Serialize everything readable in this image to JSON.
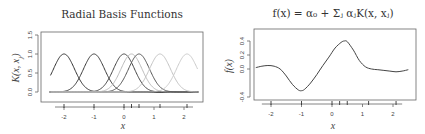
{
  "chart_data": [
    {
      "type": "line",
      "title": "Radial Basis Functions",
      "xlabel": "x",
      "ylabel": "K(x, x_j)",
      "xlim": [
        -2.5,
        2.5
      ],
      "ylim": [
        -0.1,
        1.5
      ],
      "xticks": [
        -2,
        -1,
        0,
        1,
        2
      ],
      "xtick_labels": [
        "-2",
        "-1",
        "0",
        "1",
        "2"
      ],
      "yticks": [
        0.0,
        0.5,
        1.0,
        1.5
      ],
      "ytick_labels": [
        "0.0",
        "0.5",
        "1.0",
        "1.5"
      ],
      "grid": false,
      "kernel": "gaussian",
      "bandwidth_sd": 0.35,
      "centers": [
        -2.0,
        -1.0,
        0.0,
        0.25,
        0.5,
        1.2,
        2.1
      ],
      "series_colors": [
        "#333333",
        "#3a3a3a",
        "#444444",
        "#bbbbbb",
        "#555555",
        "#c4c4c4",
        "#cccccc"
      ],
      "baseline": 0.0,
      "rug": [
        -2.0,
        -1.0,
        0.0,
        0.25,
        0.5,
        1.2,
        2.1
      ]
    },
    {
      "type": "line",
      "title": "f(x) = α₀ + Σⱼ αⱼK(x, xⱼ)",
      "xlabel": "x",
      "ylabel": "f(x)",
      "xlim": [
        -2.5,
        2.5
      ],
      "ylim": [
        -0.45,
        0.55
      ],
      "xticks": [
        -2,
        -1,
        0,
        1,
        2
      ],
      "xtick_labels": [
        "-2",
        "-1",
        "0",
        "1",
        "2"
      ],
      "yticks": [
        -0.4,
        0.0,
        0.2,
        0.4
      ],
      "ytick_labels": [
        "-0.4",
        "0.0",
        "0.2",
        "0.4"
      ],
      "grid": false,
      "x": [
        -2.5,
        -2.3,
        -2.1,
        -1.9,
        -1.7,
        -1.5,
        -1.3,
        -1.1,
        -1.0,
        -0.9,
        -0.7,
        -0.5,
        -0.3,
        -0.1,
        0.1,
        0.3,
        0.4,
        0.5,
        0.7,
        0.9,
        1.1,
        1.3,
        1.5,
        1.7,
        1.9,
        2.1,
        2.3,
        2.5
      ],
      "y": [
        0.02,
        0.04,
        0.05,
        0.04,
        0.0,
        -0.1,
        -0.22,
        -0.3,
        -0.31,
        -0.29,
        -0.2,
        -0.08,
        0.05,
        0.17,
        0.3,
        0.38,
        0.4,
        0.39,
        0.27,
        0.12,
        0.03,
        0.0,
        -0.01,
        -0.02,
        -0.03,
        -0.04,
        -0.03,
        -0.01
      ],
      "rug": [
        -2.0,
        -1.0,
        0.0,
        0.25,
        0.5,
        1.2,
        2.1
      ],
      "line_color": "#444444"
    }
  ]
}
